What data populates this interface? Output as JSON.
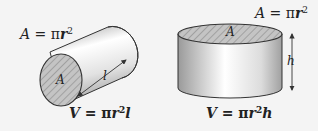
{
  "figures": [
    {
      "id": "horizontal-cylinder",
      "area_formula": {
        "lhs": "A",
        "eq": " = ",
        "pi": "π",
        "var": "r",
        "exp": "2"
      },
      "cross_section_label": "A",
      "length_label": "l",
      "volume_formula": {
        "lhs": "V",
        "eq": " = ",
        "pi": "π",
        "var": "r",
        "exp": "2",
        "suffix": "l"
      }
    },
    {
      "id": "vertical-cylinder",
      "area_formula": {
        "lhs": "A",
        "eq": " = ",
        "pi": "π",
        "var": "r",
        "exp": "2"
      },
      "cross_section_label": "A",
      "height_label": "h",
      "volume_formula": {
        "lhs": "V",
        "eq": " = ",
        "pi": "π",
        "var": "r",
        "exp": "2",
        "suffix": "h"
      }
    }
  ],
  "colors": {
    "background": "#f4f4f4",
    "outline": "#333333",
    "cylinder_light": "#ffffff",
    "cylinder_mid": "#d9d9d9",
    "cylinder_dark": "#9a9a9a",
    "hatch_fill": "#bfbfbf",
    "hatch_line": "#8a8a8a"
  }
}
